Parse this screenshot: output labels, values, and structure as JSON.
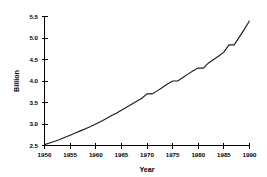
{
  "chart_data": {
    "type": "line",
    "title": "",
    "subtitle": "",
    "xlabel": "Year",
    "ylabel": "Billion",
    "xlim": [
      1950,
      1990
    ],
    "ylim": [
      2.5,
      5.5
    ],
    "grid": false,
    "legend": null,
    "legend_position": "none",
    "xticks": [
      1950,
      1955,
      1960,
      1965,
      1970,
      1975,
      1980,
      1985,
      1990
    ],
    "xtick_labels": [
      "1950",
      "1955",
      "1960",
      "1965",
      "1970",
      "1975",
      "1980",
      "1985",
      "1990"
    ],
    "yticks": [
      2.5,
      3.0,
      3.5,
      4.0,
      4.5,
      5.0,
      5.5
    ],
    "ytick_labels": [
      "2.5",
      "3.0",
      "3.5",
      "4.0",
      "4.5",
      "5.0",
      "5.5"
    ],
    "series": [
      {
        "name": "Population",
        "x": [
          1950,
          1951,
          1952,
          1953,
          1954,
          1955,
          1956,
          1957,
          1958,
          1959,
          1960,
          1961,
          1962,
          1963,
          1964,
          1965,
          1966,
          1967,
          1968,
          1969,
          1970,
          1971,
          1972,
          1973,
          1974,
          1975,
          1976,
          1977,
          1978,
          1979,
          1980,
          1981,
          1982,
          1983,
          1984,
          1985,
          1986,
          1987,
          1988,
          1989,
          1990
        ],
        "values": [
          2.52,
          2.56,
          2.6,
          2.64,
          2.69,
          2.74,
          2.79,
          2.84,
          2.89,
          2.94,
          3.0,
          3.06,
          3.12,
          3.19,
          3.25,
          3.32,
          3.39,
          3.46,
          3.53,
          3.6,
          3.7,
          3.7,
          3.77,
          3.85,
          3.93,
          4.0,
          4.0,
          4.08,
          4.16,
          4.24,
          4.3,
          4.3,
          4.42,
          4.5,
          4.58,
          4.67,
          4.84,
          4.84,
          5.02,
          5.2,
          5.4
        ]
      }
    ],
    "annotations": [],
    "axis_style": {
      "line_color": "#000000",
      "data_color": "#1a1a1a",
      "background": "#ffffff"
    }
  }
}
